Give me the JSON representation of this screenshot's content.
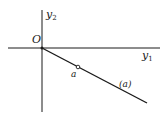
{
  "diagram": {
    "axes": {
      "horizontal": {
        "label_base": "y",
        "label_sub": "1"
      },
      "vertical": {
        "label_base": "y",
        "label_sub": "2"
      },
      "origin_label": "O"
    },
    "line": {
      "label": "(a)"
    },
    "point": {
      "label": "a"
    },
    "colors": {
      "stroke": "#1a1a1a",
      "background": "#ffffff"
    }
  }
}
